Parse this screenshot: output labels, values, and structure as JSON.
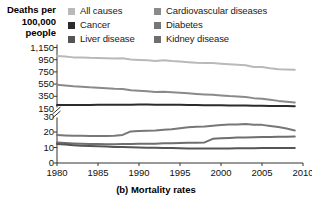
{
  "axis_title": {
    "line1": "Deaths per",
    "line2": "100,000",
    "line3": "people"
  },
  "caption": "(b) Mortality rates",
  "colors": {
    "all_causes": "#b9b9b9",
    "cancer": "#2b2b2b",
    "liver_disease": "#555555",
    "cardiovascular": "#8a8a8a",
    "diabetes": "#777777",
    "kidney_disease": "#6e6e6e",
    "axis": "#333333",
    "text": "#111111"
  },
  "legend": {
    "left": [
      {
        "label": "All causes",
        "swatch": "#b9b9b9",
        "key": "all_causes"
      },
      {
        "label": "Cancer",
        "swatch": "#2b2b2b",
        "key": "cancer"
      },
      {
        "label": "Liver disease",
        "swatch": "#555555",
        "key": "liver_disease"
      }
    ],
    "right": [
      {
        "label": "Cardiovascular diseases",
        "swatch": "#8a8a8a",
        "key": "cardiovascular"
      },
      {
        "label": "Diabetes",
        "swatch": "#777777",
        "key": "diabetes"
      },
      {
        "label": "Kidney disease",
        "swatch": "#6e6e6e",
        "key": "kidney_disease"
      }
    ]
  },
  "chart_data": {
    "type": "line",
    "title": "(b) Mortality rates",
    "xlabel": "",
    "ylabel": "Deaths per 100,000 people",
    "broken_axis": true,
    "axis_break_between": [
      30,
      150
    ],
    "x": [
      1980,
      1981,
      1982,
      1983,
      1984,
      1985,
      1986,
      1987,
      1988,
      1989,
      1990,
      1991,
      1992,
      1993,
      1994,
      1995,
      1996,
      1997,
      1998,
      1999,
      2000,
      2001,
      2002,
      2003,
      2004,
      2005,
      2006,
      2007,
      2008,
      2009
    ],
    "xticks": [
      1980,
      1985,
      1990,
      1995,
      2000,
      2005,
      2010
    ],
    "yticks_upper": [
      150,
      350,
      550,
      750,
      950,
      1150
    ],
    "yticks_lower": [
      0,
      10,
      20,
      30
    ],
    "ytick_labels": [
      "0",
      "10",
      "20",
      "30",
      "150",
      "350",
      "550",
      "750",
      "950",
      "1,150"
    ],
    "xlim": [
      1980,
      2010
    ],
    "grid": false,
    "legend_position": "top",
    "series": [
      {
        "name": "All causes",
        "color": "#b9b9b9",
        "scale": "upper",
        "values": [
          1010,
          1002,
          988,
          986,
          980,
          978,
          972,
          968,
          972,
          952,
          945,
          940,
          930,
          940,
          928,
          921,
          910,
          900,
          896,
          896,
          885,
          876,
          868,
          858,
          830,
          830,
          808,
          793,
          790,
          785
        ]
      },
      {
        "name": "Cardiovascular diseases",
        "color": "#8a8a8a",
        "scale": "upper",
        "values": [
          540,
          528,
          515,
          508,
          498,
          492,
          482,
          472,
          470,
          450,
          442,
          432,
          422,
          425,
          418,
          410,
          398,
          388,
          380,
          375,
          365,
          355,
          348,
          338,
          320,
          310,
          292,
          275,
          262,
          250
        ]
      },
      {
        "name": "Cancer",
        "color": "#2b2b2b",
        "scale": "upper",
        "values": [
          207,
          207,
          208,
          208,
          209,
          210,
          210,
          211,
          212,
          213,
          214,
          214,
          213,
          213,
          212,
          211,
          209,
          207,
          205,
          204,
          203,
          201,
          200,
          198,
          196,
          194,
          192,
          190,
          189,
          188
        ]
      },
      {
        "name": "Diabetes",
        "color": "#777777",
        "scale": "lower",
        "values": [
          18.1,
          17.8,
          17.6,
          17.6,
          17.5,
          17.4,
          17.4,
          17.6,
          18.1,
          20.4,
          20.7,
          20.8,
          21.0,
          21.4,
          21.8,
          22.4,
          23.1,
          23.4,
          23.6,
          24.1,
          24.5,
          24.8,
          24.9,
          25.1,
          24.6,
          24.6,
          23.9,
          23.2,
          22.2,
          21.0
        ]
      },
      {
        "name": "Kidney disease",
        "color": "#6e6e6e",
        "scale": "lower",
        "values": [
          13.2,
          12.9,
          12.6,
          12.4,
          12.3,
          12.2,
          12.1,
          12.1,
          12.2,
          12.3,
          12.4,
          12.4,
          12.5,
          12.7,
          12.8,
          12.9,
          13.0,
          13.1,
          13.3,
          15.6,
          16.0,
          16.2,
          16.4,
          16.5,
          16.6,
          16.7,
          16.8,
          16.9,
          17.0,
          17.1
        ]
      },
      {
        "name": "Liver disease",
        "color": "#555555",
        "scale": "lower",
        "values": [
          12.2,
          11.9,
          11.5,
          11.2,
          11.0,
          10.8,
          10.6,
          10.4,
          10.3,
          10.1,
          10.0,
          9.9,
          9.8,
          9.7,
          9.6,
          9.5,
          9.4,
          9.4,
          9.3,
          9.3,
          9.4,
          9.4,
          9.5,
          9.5,
          9.5,
          9.6,
          9.6,
          9.6,
          9.7,
          9.7
        ]
      }
    ]
  }
}
